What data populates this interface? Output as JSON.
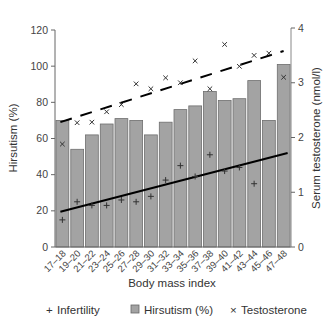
{
  "chart_data": {
    "type": "bar",
    "title": "",
    "xlabel": "Body mass index",
    "ylabel": "Hirsutism (%)",
    "ylabel_right": "Serum testosterone (nmol/l)",
    "ylim": [
      0,
      120
    ],
    "ylim_right": [
      0,
      4
    ],
    "yticks": [
      0,
      20,
      40,
      60,
      80,
      100,
      120
    ],
    "yticks_right": [
      0,
      1,
      2,
      3,
      4
    ],
    "grid": false,
    "legend_position": "bottom",
    "categories": [
      "17–18",
      "19–20",
      "21–22",
      "23–24",
      "25–26",
      "27–28",
      "29–30",
      "31–32",
      "33–34",
      "35–36",
      "37–38",
      "39–40",
      "41–42",
      "43–44",
      "45–46",
      "47–48"
    ],
    "series": [
      {
        "name": "Hirsutism (%)",
        "type": "bar",
        "axis": "left",
        "color": "#a3a3a3",
        "values": [
          70,
          54,
          62,
          68,
          71,
          70,
          62,
          69,
          76,
          78,
          86,
          81,
          82,
          92,
          70,
          101
        ]
      },
      {
        "name": "Infertility",
        "type": "scatter",
        "marker": "+",
        "axis": "left",
        "values": [
          15,
          25,
          23,
          23,
          26,
          25,
          28,
          37,
          45,
          39,
          51,
          42,
          44,
          35,
          null,
          null
        ],
        "trendline": {
          "style": "solid",
          "from": [
            0,
            19.5
          ],
          "to": [
            15,
            52
          ]
        }
      },
      {
        "name": "Testosterone",
        "type": "scatter",
        "marker": "x",
        "axis": "right",
        "values": [
          1.88,
          2.27,
          2.28,
          2.47,
          2.6,
          2.98,
          2.89,
          3.09,
          3.0,
          3.4,
          2.89,
          3.7,
          3.3,
          3.5,
          3.54,
          3.1
        ],
        "trendline": {
          "style": "dashed",
          "from": [
            0,
            2.28
          ],
          "to": [
            15,
            3.58
          ]
        }
      }
    ]
  },
  "legend": {
    "items": [
      {
        "symbol": "+",
        "label": "Infertility"
      },
      {
        "symbol": "■",
        "label": "Hirsutism (%)"
      },
      {
        "symbol": "×",
        "label": "Testosterone"
      }
    ]
  },
  "axes": {
    "left_ticks": [
      "0",
      "20",
      "40",
      "60",
      "80",
      "100",
      "120"
    ],
    "right_ticks": [
      "0",
      "1",
      "2",
      "3",
      "4"
    ]
  }
}
